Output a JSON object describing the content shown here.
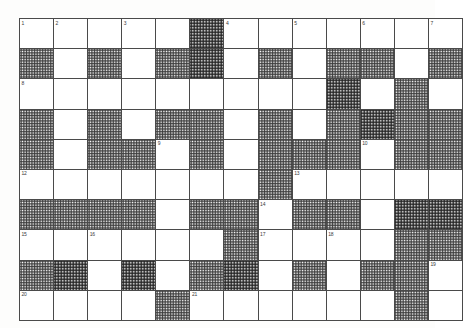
{
  "puzzle": {
    "kind": "crossword-grid",
    "columns": 12,
    "rows": 10,
    "colors": {
      "page_background": "#fdfdfc",
      "cell_background": "#ffffff",
      "blocked_fill": "#8c8c8c",
      "grid_line": "#4a4a4a",
      "outer_border": "#2a2a2a",
      "number_text": "#3b3b3b"
    },
    "clue_numbers_present": [
      "1",
      "2",
      "3",
      "4",
      "5",
      "6",
      "7",
      "8",
      "9",
      "10",
      "11",
      "12",
      "13",
      "14",
      "15",
      "16",
      "17",
      "18",
      "19",
      "20",
      "21"
    ],
    "legend": {
      "open": "white answer square",
      "blocked": "shaded (halftone) blocked square"
    },
    "grid": [
      [
        {
          "state": "open",
          "number": "1"
        },
        {
          "state": "open",
          "number": "2"
        },
        {
          "state": "open",
          "number": ""
        },
        {
          "state": "open",
          "number": "3"
        },
        {
          "state": "open",
          "number": ""
        },
        {
          "state": "blocked",
          "number": "",
          "dark": true
        },
        {
          "state": "open",
          "number": "4"
        },
        {
          "state": "open",
          "number": ""
        },
        {
          "state": "open",
          "number": "5"
        },
        {
          "state": "open",
          "number": ""
        },
        {
          "state": "open",
          "number": "6"
        },
        {
          "state": "open",
          "number": ""
        },
        {
          "state": "open",
          "number": "7"
        }
      ],
      [
        {
          "state": "blocked",
          "number": ""
        },
        {
          "state": "open",
          "number": ""
        },
        {
          "state": "blocked",
          "number": ""
        },
        {
          "state": "open",
          "number": ""
        },
        {
          "state": "blocked",
          "number": ""
        },
        {
          "state": "blocked",
          "number": "",
          "dark": true
        },
        {
          "state": "open",
          "number": ""
        },
        {
          "state": "blocked",
          "number": ""
        },
        {
          "state": "open",
          "number": ""
        },
        {
          "state": "blocked",
          "number": ""
        },
        {
          "state": "blocked",
          "number": ""
        },
        {
          "state": "open",
          "number": ""
        },
        {
          "state": "blocked",
          "number": ""
        }
      ],
      [
        {
          "state": "open",
          "number": "8"
        },
        {
          "state": "open",
          "number": ""
        },
        {
          "state": "open",
          "number": ""
        },
        {
          "state": "open",
          "number": ""
        },
        {
          "state": "open",
          "number": ""
        },
        {
          "state": "open",
          "number": ""
        },
        {
          "state": "open",
          "number": ""
        },
        {
          "state": "open",
          "number": ""
        },
        {
          "state": "open",
          "number": ""
        },
        {
          "state": "blocked",
          "number": "",
          "dark": true
        },
        {
          "state": "open",
          "number": ""
        },
        {
          "state": "blocked",
          "number": ""
        },
        {
          "state": "open",
          "number": ""
        }
      ],
      [
        {
          "state": "blocked",
          "number": ""
        },
        {
          "state": "open",
          "number": ""
        },
        {
          "state": "blocked",
          "number": ""
        },
        {
          "state": "open",
          "number": ""
        },
        {
          "state": "blocked",
          "number": ""
        },
        {
          "state": "blocked",
          "number": ""
        },
        {
          "state": "open",
          "number": ""
        },
        {
          "state": "blocked",
          "number": ""
        },
        {
          "state": "open",
          "number": ""
        },
        {
          "state": "blocked",
          "number": ""
        },
        {
          "state": "blocked",
          "number": "",
          "dark": true
        },
        {
          "state": "blocked",
          "number": ""
        },
        {
          "state": "blocked",
          "number": ""
        }
      ],
      [
        {
          "state": "blocked",
          "number": ""
        },
        {
          "state": "open",
          "number": ""
        },
        {
          "state": "blocked",
          "number": ""
        },
        {
          "state": "blocked",
          "number": ""
        },
        {
          "state": "open",
          "number": "9"
        },
        {
          "state": "blocked",
          "number": ""
        },
        {
          "state": "open",
          "number": ""
        },
        {
          "state": "blocked",
          "number": ""
        },
        {
          "state": "blocked",
          "number": ""
        },
        {
          "state": "blocked",
          "number": ""
        },
        {
          "state": "open",
          "number": "10"
        },
        {
          "state": "blocked",
          "number": ""
        },
        {
          "state": "blocked",
          "number": ""
        }
      ],
      [
        {
          "state": "open",
          "number": "12"
        },
        {
          "state": "open",
          "number": ""
        },
        {
          "state": "open",
          "number": ""
        },
        {
          "state": "open",
          "number": ""
        },
        {
          "state": "open",
          "number": ""
        },
        {
          "state": "open",
          "number": ""
        },
        {
          "state": "open",
          "number": ""
        },
        {
          "state": "blocked",
          "number": ""
        },
        {
          "state": "open",
          "number": "13"
        },
        {
          "state": "open",
          "number": ""
        },
        {
          "state": "open",
          "number": ""
        },
        {
          "state": "open",
          "number": ""
        },
        {
          "state": "open",
          "number": ""
        }
      ],
      [
        {
          "state": "blocked",
          "number": ""
        },
        {
          "state": "blocked",
          "number": ""
        },
        {
          "state": "blocked",
          "number": ""
        },
        {
          "state": "blocked",
          "number": ""
        },
        {
          "state": "open",
          "number": ""
        },
        {
          "state": "blocked",
          "number": ""
        },
        {
          "state": "blocked",
          "number": ""
        },
        {
          "state": "open",
          "number": "14"
        },
        {
          "state": "blocked",
          "number": ""
        },
        {
          "state": "blocked",
          "number": ""
        },
        {
          "state": "open",
          "number": ""
        },
        {
          "state": "blocked",
          "number": "",
          "dark": true
        },
        {
          "state": "blocked",
          "number": "",
          "dark": true
        }
      ],
      [
        {
          "state": "open",
          "number": "15"
        },
        {
          "state": "open",
          "number": ""
        },
        {
          "state": "open",
          "number": "16"
        },
        {
          "state": "open",
          "number": ""
        },
        {
          "state": "open",
          "number": ""
        },
        {
          "state": "open",
          "number": ""
        },
        {
          "state": "blocked",
          "number": ""
        },
        {
          "state": "open",
          "number": "17"
        },
        {
          "state": "open",
          "number": ""
        },
        {
          "state": "open",
          "number": "18"
        },
        {
          "state": "open",
          "number": ""
        },
        {
          "state": "blocked",
          "number": ""
        },
        {
          "state": "blocked",
          "number": ""
        }
      ],
      [
        {
          "state": "blocked",
          "number": ""
        },
        {
          "state": "blocked",
          "number": "",
          "dark": true
        },
        {
          "state": "open",
          "number": ""
        },
        {
          "state": "blocked",
          "number": "",
          "dark": true
        },
        {
          "state": "open",
          "number": ""
        },
        {
          "state": "blocked",
          "number": ""
        },
        {
          "state": "blocked",
          "number": "",
          "dark": true
        },
        {
          "state": "open",
          "number": ""
        },
        {
          "state": "blocked",
          "number": ""
        },
        {
          "state": "open",
          "number": ""
        },
        {
          "state": "blocked",
          "number": ""
        },
        {
          "state": "blocked",
          "number": ""
        },
        {
          "state": "open",
          "number": "19"
        }
      ],
      [
        {
          "state": "open",
          "number": "20"
        },
        {
          "state": "open",
          "number": ""
        },
        {
          "state": "open",
          "number": ""
        },
        {
          "state": "open",
          "number": ""
        },
        {
          "state": "blocked",
          "number": ""
        },
        {
          "state": "open",
          "number": "21"
        },
        {
          "state": "open",
          "number": ""
        },
        {
          "state": "open",
          "number": ""
        },
        {
          "state": "open",
          "number": ""
        },
        {
          "state": "open",
          "number": ""
        },
        {
          "state": "open",
          "number": ""
        },
        {
          "state": "blocked",
          "number": ""
        },
        {
          "state": "open",
          "number": ""
        }
      ]
    ]
  }
}
